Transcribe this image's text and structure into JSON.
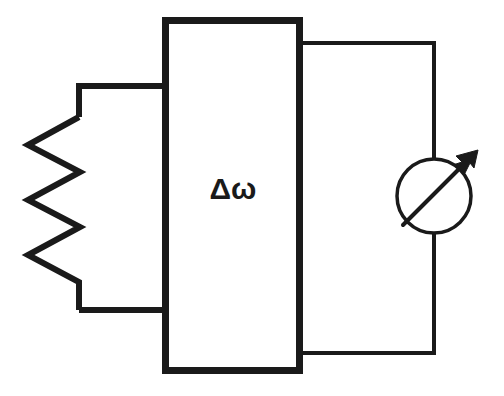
{
  "diagram": {
    "background_color": "#ffffff",
    "stroke_color": "#1a1a1a",
    "components": {
      "resistor": {
        "name": "zigzag-resistor",
        "label": "",
        "stroke_width": 6,
        "left_vertices_x": 28,
        "right_vertices_x": 80,
        "top_wire_y": 86,
        "bottom_wire_y": 310
      },
      "center_box": {
        "name": "delta-omega-box",
        "label": "Δω",
        "x": 162,
        "y": 17,
        "width": 141,
        "height": 357,
        "stroke_width": 7,
        "fill": "#ffffff"
      },
      "meter": {
        "name": "meter-gauge",
        "label": "",
        "center_x": 434,
        "center_y": 196,
        "radius": 37,
        "stroke_width": 3,
        "needle_angle_deg": -45
      },
      "wires": {
        "name": "connection-wires",
        "stroke_width": 4,
        "top_right_y": 43,
        "bottom_right_y": 353,
        "right_rail_x": 434,
        "box_right_x": 303
      }
    }
  }
}
